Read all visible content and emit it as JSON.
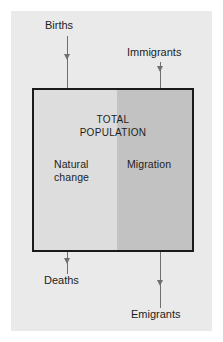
{
  "figure": {
    "background_color": "#eaeaea",
    "page_color": "#ffffff"
  },
  "population_box": {
    "title": "TOTAL\nPOPULATION",
    "border_color": "#1a1a1a",
    "regions": [
      {
        "key": "natural_change",
        "label": "Natural\nchange",
        "color": "#dddddd",
        "width_fraction": 0.525
      },
      {
        "key": "migration",
        "label": "Migration",
        "color": "#c2c2c2",
        "width_fraction": 0.475
      }
    ]
  },
  "flows": {
    "inflows": [
      {
        "key": "births",
        "label": "Births",
        "direction": "down",
        "target_region": "natural_change"
      },
      {
        "key": "immigrants",
        "label": "Immigrants",
        "direction": "down",
        "target_region": "migration"
      }
    ],
    "outflows": [
      {
        "key": "deaths",
        "label": "Deaths",
        "direction": "down",
        "source_region": "natural_change"
      },
      {
        "key": "emigrants",
        "label": "Emigrants",
        "direction": "down",
        "source_region": "migration"
      }
    ],
    "arrow_color": "#6f6f6f"
  },
  "chart_data": {
    "type": "diagram",
    "title": "TOTAL POPULATION",
    "compartments": [
      {
        "name": "Natural change",
        "share": 0.525,
        "color": "#dddddd"
      },
      {
        "name": "Migration",
        "share": 0.475,
        "color": "#c2c2c2"
      }
    ],
    "inputs": [
      "Births",
      "Immigrants"
    ],
    "outputs": [
      "Deaths",
      "Emigrants"
    ],
    "annotations": [
      "Births",
      "Immigrants",
      "TOTAL POPULATION",
      "Natural change",
      "Migration",
      "Deaths",
      "Emigrants"
    ]
  }
}
